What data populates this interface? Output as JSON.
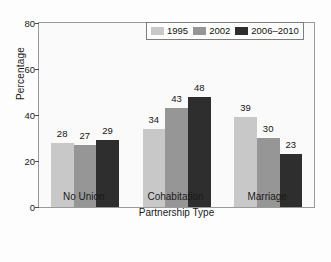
{
  "chart_data": {
    "type": "bar",
    "title": "",
    "xlabel": "Partnership Type",
    "ylabel": "Percentage",
    "categories": [
      "No Union",
      "Cohabitation",
      "Marriage"
    ],
    "series": [
      {
        "name": "1995",
        "color": "#c8c8c8",
        "values": [
          28,
          34,
          39
        ]
      },
      {
        "name": "2002",
        "color": "#969696",
        "values": [
          27,
          43,
          30
        ]
      },
      {
        "name": "2006–2010",
        "color": "#2e2e2e",
        "values": [
          29,
          48,
          23
        ]
      }
    ],
    "ylim": [
      0,
      80
    ],
    "yticks": [
      0,
      20,
      40,
      60,
      80
    ],
    "grid": false,
    "legend_position": "top-right",
    "value_labels": true
  },
  "axes": {
    "y_title": "Percentage",
    "x_title": "Partnership Type",
    "y_tick_labels": [
      "0",
      "20",
      "40",
      "60",
      "80"
    ],
    "x_tick_labels": [
      "No Union",
      "Cohabitation",
      "Marriage"
    ]
  },
  "legend": {
    "entries": [
      {
        "label": "1995",
        "color": "#c8c8c8"
      },
      {
        "label": "2002",
        "color": "#969696"
      },
      {
        "label": "2006–2010",
        "color": "#2e2e2e"
      }
    ]
  },
  "bar_labels": {
    "no_union": [
      "28",
      "27",
      "29"
    ],
    "cohabitation": [
      "34",
      "43",
      "48"
    ],
    "marriage": [
      "39",
      "30",
      "23"
    ]
  }
}
